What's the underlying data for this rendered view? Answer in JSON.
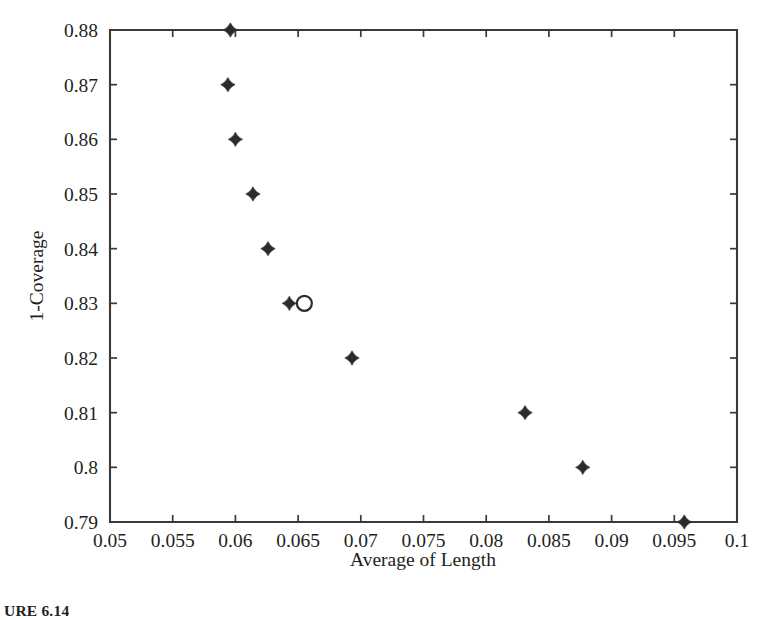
{
  "figure": {
    "caption": "URE 6.14"
  },
  "chart_data": {
    "type": "scatter",
    "title": "",
    "xlabel": "Average of Length",
    "ylabel": "1-Coverage",
    "xlim": [
      0.05,
      0.1
    ],
    "ylim": [
      0.79,
      0.88
    ],
    "grid": false,
    "legend": "none",
    "xticks": [
      0.05,
      0.055,
      0.06,
      0.065,
      0.07,
      0.075,
      0.08,
      0.085,
      0.09,
      0.095,
      0.1
    ],
    "xtick_labels": [
      "0.05",
      "0.055",
      "0.06",
      "0.065",
      "0.07",
      "0.075",
      "0.08",
      "0.085",
      "0.09",
      "0.095",
      "0.1"
    ],
    "yticks": [
      0.79,
      0.8,
      0.81,
      0.82,
      0.83,
      0.84,
      0.85,
      0.86,
      0.87,
      0.88
    ],
    "ytick_labels": [
      "0.79",
      "0.8",
      "0.81",
      "0.82",
      "0.83",
      "0.84",
      "0.85",
      "0.86",
      "0.87",
      "0.88"
    ],
    "series": [
      {
        "name": "solutions",
        "marker": "filled-diamond",
        "color": "#2b2b2b",
        "points": [
          {
            "x": 0.0596,
            "y": 0.88
          },
          {
            "x": 0.0594,
            "y": 0.87
          },
          {
            "x": 0.06,
            "y": 0.86
          },
          {
            "x": 0.0614,
            "y": 0.85
          },
          {
            "x": 0.0626,
            "y": 0.84
          },
          {
            "x": 0.0643,
            "y": 0.83
          },
          {
            "x": 0.0693,
            "y": 0.82
          },
          {
            "x": 0.0831,
            "y": 0.81
          },
          {
            "x": 0.0877,
            "y": 0.8
          },
          {
            "x": 0.0958,
            "y": 0.79
          }
        ]
      },
      {
        "name": "selected",
        "marker": "open-circle",
        "color": "#2b2b2b",
        "points": [
          {
            "x": 0.0655,
            "y": 0.83
          }
        ]
      }
    ]
  }
}
